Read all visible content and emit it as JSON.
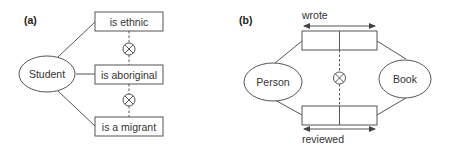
{
  "diagram": {
    "panel_a": {
      "label": "(a)",
      "entity": "Student",
      "roles": [
        "is ethnic",
        "is aboriginal",
        "is a migrant"
      ],
      "constraint_symbol": "⊗",
      "constraint_name": "exclusion"
    },
    "panel_b": {
      "label": "(b)",
      "entities": [
        "Person",
        "Book"
      ],
      "fact_types": [
        {
          "reading": "wrote",
          "roles": 2
        },
        {
          "reading": "reviewed",
          "roles": 2
        }
      ],
      "constraint_symbol": "⊗",
      "constraint_name": "exclusion"
    },
    "colors": {
      "stroke": "#555555",
      "text": "#333333",
      "background": "#ffffff"
    }
  }
}
